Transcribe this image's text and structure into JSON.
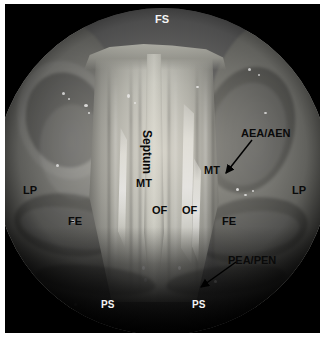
{
  "figure": {
    "kind": "endoscopic-photograph",
    "view": "circular endoscopic field",
    "background_color": "#000000",
    "page_color": "#ffffff"
  },
  "annotations": {
    "frontal_sinus": {
      "abbr": "FS",
      "color": "#f4f4f4",
      "x": 155,
      "y": 14,
      "rotated": false,
      "has_arrow": false
    },
    "septum": {
      "abbr": "Septum",
      "color": "#0a0a0a",
      "x": 153,
      "y": 130,
      "rotated": true,
      "has_arrow": false
    },
    "middle_turbinate_left": {
      "abbr": "MT",
      "color": "#0a0a0a",
      "x": 136,
      "y": 178,
      "rotated": false,
      "has_arrow": false
    },
    "middle_turbinate_right": {
      "abbr": "MT",
      "color": "#0a0a0a",
      "x": 204,
      "y": 165,
      "rotated": false,
      "has_arrow": false
    },
    "olfactory_fossa_left": {
      "abbr": "OF",
      "color": "#0a0a0a",
      "x": 152,
      "y": 205,
      "rotated": false,
      "has_arrow": false
    },
    "olfactory_fossa_right": {
      "abbr": "OF",
      "color": "#0a0a0a",
      "x": 182,
      "y": 205,
      "rotated": false,
      "has_arrow": false
    },
    "lamina_papyracea_left": {
      "abbr": "LP",
      "color": "#0a0a0a",
      "x": 23,
      "y": 185,
      "rotated": false,
      "has_arrow": false
    },
    "lamina_papyracea_right": {
      "abbr": "LP",
      "color": "#0a0a0a",
      "x": 292,
      "y": 185,
      "rotated": false,
      "has_arrow": false
    },
    "fovea_ethmoidalis_left": {
      "abbr": "FE",
      "color": "#0a0a0a",
      "x": 68,
      "y": 216,
      "rotated": false,
      "has_arrow": false
    },
    "fovea_ethmoidalis_right": {
      "abbr": "FE",
      "color": "#0a0a0a",
      "x": 222,
      "y": 216,
      "rotated": false,
      "has_arrow": false
    },
    "anterior_ethmoid_artery_nerve": {
      "abbr": "AEA/AEN",
      "color": "#0a0a0a",
      "x": 241,
      "y": 128,
      "rotated": false,
      "has_arrow": true,
      "arrow": {
        "x1": 252,
        "y1": 140,
        "x2": 226,
        "y2": 173
      }
    },
    "posterior_ethmoid_artery_nerve": {
      "abbr": "PEA/PEN",
      "color": "#0a0a0a",
      "x": 228,
      "y": 255,
      "rotated": false,
      "has_arrow": true,
      "arrow": {
        "x1": 236,
        "y1": 262,
        "x2": 201,
        "y2": 287
      }
    },
    "planum_sphenoidale_left": {
      "abbr": "PS",
      "color": "#f4f4f4",
      "x": 101,
      "y": 300,
      "rotated": false,
      "has_arrow": false
    },
    "planum_sphenoidale_right": {
      "abbr": "PS",
      "color": "#f4f4f4",
      "x": 192,
      "y": 300,
      "rotated": false,
      "has_arrow": false
    }
  }
}
